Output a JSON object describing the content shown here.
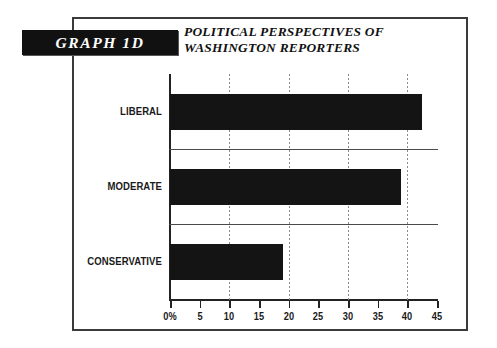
{
  "badge": {
    "label": "GRAPH 1D"
  },
  "title": {
    "line1": "POLITICAL PERSPECTIVES OF",
    "line2": "WASHINGTON REPORTERS"
  },
  "axis": {
    "tick_labels": [
      "0%",
      "5",
      "10",
      "15",
      "20",
      "25",
      "30",
      "35",
      "40",
      "45"
    ]
  },
  "categories": [
    "LIBERAL",
    "MODERATE",
    "CONSERVATIVE"
  ],
  "chart_data": {
    "type": "bar",
    "orientation": "horizontal",
    "title": "POLITICAL PERSPECTIVES OF WASHINGTON REPORTERS",
    "badge": "GRAPH 1D",
    "categories": [
      "LIBERAL",
      "MODERATE",
      "CONSERVATIVE"
    ],
    "values": [
      42.5,
      39,
      19
    ],
    "unit": "percent",
    "xlabel": "",
    "ylabel": "",
    "xlim": [
      0,
      45
    ],
    "xticks": [
      0,
      5,
      10,
      15,
      20,
      25,
      30,
      35,
      40,
      45
    ],
    "xtick_labels": [
      "0%",
      "5",
      "10",
      "15",
      "20",
      "25",
      "30",
      "35",
      "40",
      "45"
    ],
    "gridlines": [
      10,
      20,
      30,
      40
    ],
    "grid": "vertical-dotted",
    "legend": "none",
    "bar_color": "#141414"
  },
  "colors": {
    "bar": "#141414",
    "frame": "#3a3a3a",
    "badge_bg": "#111111",
    "badge_text": "#ffffff",
    "grid": "#8a8a8a"
  }
}
